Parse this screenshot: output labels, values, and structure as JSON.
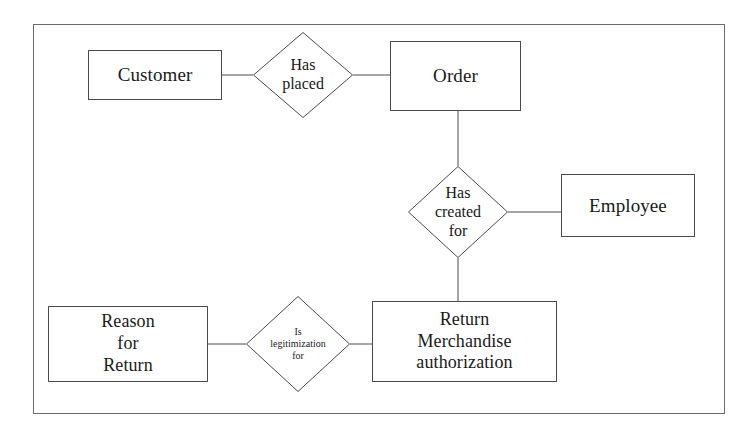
{
  "diagram": {
    "type": "entity-relationship-diagram",
    "background_color": "#ffffff",
    "line_color": "#4a4a4a",
    "text_color": "#1a1a1a",
    "frame": {
      "x": 33,
      "y": 24,
      "width": 692,
      "height": 390
    },
    "entities": [
      {
        "id": "customer",
        "label": "Customer",
        "x": 88,
        "y": 50,
        "width": 134,
        "height": 50,
        "font_size": 19
      },
      {
        "id": "order",
        "label": "Order",
        "x": 390,
        "y": 41,
        "width": 131,
        "height": 70,
        "font_size": 19
      },
      {
        "id": "employee",
        "label": "Employee",
        "x": 561,
        "y": 174,
        "width": 134,
        "height": 63,
        "font_size": 19
      },
      {
        "id": "reason-for-return",
        "label": "Reason\nfor\nReturn",
        "x": 48,
        "y": 306,
        "width": 160,
        "height": 76,
        "font_size": 18
      },
      {
        "id": "return-merchandise-authorization",
        "label": "Return\nMerchandise\nauthorization",
        "x": 372,
        "y": 301,
        "width": 185,
        "height": 81,
        "font_size": 18
      }
    ],
    "relationships": [
      {
        "id": "has-placed",
        "label": "Has\nplaced",
        "cx": 303,
        "cy": 75,
        "half_width": 50,
        "half_height": 43,
        "font_size": 16
      },
      {
        "id": "has-created-for",
        "label": "Has\ncreated\nfor",
        "cx": 458,
        "cy": 212,
        "half_width": 50,
        "half_height": 46,
        "font_size": 16
      },
      {
        "id": "is-legitimization-for",
        "label": "Is\nlegitimization\nfor",
        "cx": 298,
        "cy": 344,
        "half_width": 52,
        "half_height": 48,
        "font_size": 10
      }
    ],
    "connectors": [
      {
        "id": "customer-to-has-placed",
        "x1": 222,
        "y1": 75,
        "x2": 253,
        "y2": 75
      },
      {
        "id": "has-placed-to-order",
        "x1": 353,
        "y1": 75,
        "x2": 390,
        "y2": 75
      },
      {
        "id": "order-to-has-created-for",
        "x1": 458,
        "y1": 111,
        "x2": 458,
        "y2": 166
      },
      {
        "id": "has-created-for-to-employee",
        "x1": 508,
        "y1": 212,
        "x2": 561,
        "y2": 212
      },
      {
        "id": "has-created-for-to-rma",
        "x1": 458,
        "y1": 258,
        "x2": 458,
        "y2": 301
      },
      {
        "id": "reason-to-is-legitimization-for",
        "x1": 208,
        "y1": 344,
        "x2": 246,
        "y2": 344
      },
      {
        "id": "is-legitimization-for-to-rma",
        "x1": 350,
        "y1": 344,
        "x2": 372,
        "y2": 344
      }
    ]
  }
}
